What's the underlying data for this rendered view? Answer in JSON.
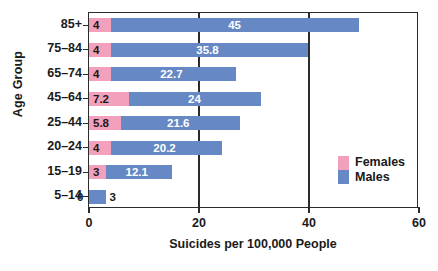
{
  "chart_data": {
    "type": "bar",
    "orientation": "horizontal",
    "stacked": true,
    "title": "",
    "xlabel": "Suicides per 100,000 People",
    "ylabel": "Age Group",
    "xlim": [
      0,
      60
    ],
    "xticks": [
      "0",
      "20",
      "40",
      "60"
    ],
    "xtick_values": [
      0,
      20,
      40,
      60
    ],
    "gridlines": [
      20,
      40
    ],
    "grid": true,
    "legend_position": "right-inside",
    "categories": [
      "85+",
      "75–84",
      "65–74",
      "45–64",
      "25–44",
      "20–24",
      "15–19",
      "5–14"
    ],
    "series": [
      {
        "name": "Females",
        "color": "#f2a0bc",
        "values": [
          4,
          4,
          4,
          7.2,
          5.8,
          4,
          3,
          0
        ],
        "labels": [
          "4",
          "4",
          "4",
          "7.2",
          "5.8",
          "4",
          "3",
          "0"
        ]
      },
      {
        "name": "Males",
        "color": "#6688c4",
        "values": [
          45,
          35.8,
          22.7,
          24,
          21.6,
          20.2,
          12.1,
          3
        ],
        "labels": [
          "45",
          "35.8",
          "22.7",
          "24",
          "21.6",
          "20.2",
          "12.1",
          "3"
        ]
      }
    ]
  },
  "legend": {
    "entries": [
      {
        "label": "Females",
        "color": "#f2a0bc"
      },
      {
        "label": "Males",
        "color": "#6688c4"
      }
    ]
  }
}
